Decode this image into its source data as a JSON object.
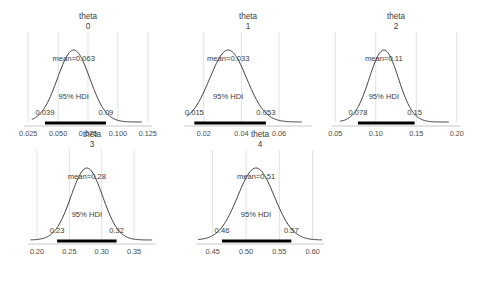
{
  "figure": {
    "kind": "posterior-density-grid",
    "n_panels": 5,
    "hdi_label": "95% HDI",
    "mean_prefix": "mean=",
    "title_prefix": "theta"
  },
  "chart_data": {
    "type": "line",
    "title": "",
    "subtitle": "",
    "xlabel": "",
    "ylabel": "",
    "grid": true,
    "legend": null,
    "panels": [
      {
        "title_line1": "theta",
        "title_line2": "0",
        "mean_label": "mean=0.063",
        "mean": 0.063,
        "hdi_label": "95% HDI",
        "hdi_low_label": "0.039",
        "hdi_high_label": "0.09",
        "hdi": [
          0.039,
          0.09
        ],
        "sd": 0.0135,
        "xlim": [
          0.0215,
          0.1285
        ],
        "ticks": [
          0.025,
          0.05,
          0.075,
          0.1,
          0.125
        ],
        "tick_labels": [
          "0.025",
          "0.050",
          "0.075",
          "0.100",
          "0.125"
        ],
        "curve_range": [
          0.028,
          0.12
        ]
      },
      {
        "title_line1": "theta",
        "title_line2": "1",
        "mean_label": "mean=0.033",
        "mean": 0.033,
        "hdi_label": "95% HDI",
        "hdi_low_label": "0.015",
        "hdi_high_label": "0.053",
        "hdi": [
          0.015,
          0.053
        ],
        "sd": 0.0098,
        "xlim": [
          0.0095,
          0.0775
        ],
        "ticks": [
          0.02,
          0.04,
          0.06
        ],
        "tick_labels": [
          "0.02",
          "0.04",
          "0.06"
        ],
        "curve_range": [
          0.011,
          0.072
        ]
      },
      {
        "title_line1": "theta",
        "title_line2": "2",
        "mean_label": "mean=0.11",
        "mean": 0.11,
        "hdi_label": "95% HDI",
        "hdi_low_label": "0.078",
        "hdi_high_label": "0.15",
        "hdi": [
          0.078,
          0.148
        ],
        "sd": 0.018,
        "xlim": [
          0.046,
          0.204
        ],
        "ticks": [
          0.05,
          0.1,
          0.15,
          0.2
        ],
        "tick_labels": [
          "0.05",
          "0.10",
          "0.15",
          "0.20"
        ],
        "curve_range": [
          0.056,
          0.19
        ]
      },
      {
        "title_line1": "theta",
        "title_line2": "3",
        "mean_label": "mean=0.28",
        "mean": 0.277,
        "hdi_label": "95% HDI",
        "hdi_low_label": "0.23",
        "hdi_high_label": "0.32",
        "hdi": [
          0.231,
          0.323
        ],
        "sd": 0.0245,
        "xlim": [
          0.186,
          0.384
        ],
        "ticks": [
          0.2,
          0.25,
          0.3,
          0.35
        ],
        "tick_labels": [
          "0.20",
          "0.25",
          "0.30",
          "0.35"
        ],
        "curve_range": [
          0.19,
          0.378
        ]
      },
      {
        "title_line1": "theta",
        "title_line2": "4",
        "mean_label": "mean=0.51",
        "mean": 0.515,
        "hdi_label": "95% HDI",
        "hdi_low_label": "0.46",
        "hdi_high_label": "0.57",
        "hdi": [
          0.464,
          0.568
        ],
        "sd": 0.0275,
        "xlim": [
          0.425,
          0.617
        ],
        "ticks": [
          0.45,
          0.5,
          0.55,
          0.6
        ],
        "tick_labels": [
          "0.45",
          "0.50",
          "0.55",
          "0.60"
        ],
        "curve_range": [
          0.428,
          0.614
        ]
      }
    ],
    "style": {
      "curve_color": "#3b3b3b",
      "hdi_bar_color": "#000000",
      "grid_color": "#d9d9d9",
      "axis_color": "#c8c8c8",
      "text_color": "#3c3c3c",
      "background": "#ffffff"
    }
  },
  "layout": {
    "panel_geometry": [
      {
        "left": 18,
        "top": 22,
        "plot_left": 24,
        "plot_top": 32,
        "plot_w": 128,
        "plot_h": 94,
        "tick_y": 127,
        "title_w": 128,
        "title_left": 24
      },
      {
        "left": 178,
        "top": 22,
        "plot_left": 184,
        "plot_top": 32,
        "plot_w": 128,
        "plot_h": 94,
        "tick_y": 127,
        "title_w": 128,
        "title_left": 184
      },
      {
        "left": 338,
        "top": 22,
        "plot_left": 332,
        "plot_top": 32,
        "plot_w": 128,
        "plot_h": 94,
        "tick_y": 127,
        "title_w": 128,
        "title_left": 332
      },
      {
        "left": 18,
        "top": 140,
        "plot_left": 28,
        "plot_top": 150,
        "plot_w": 128,
        "plot_h": 94,
        "tick_y": 264,
        "title_w": 128,
        "title_left": 28
      },
      {
        "left": 178,
        "top": 140,
        "plot_left": 196,
        "plot_top": 150,
        "plot_w": 128,
        "plot_h": 94,
        "tick_y": 264,
        "title_w": 128,
        "title_left": 196
      }
    ]
  }
}
